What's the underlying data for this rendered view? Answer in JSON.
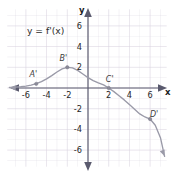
{
  "figure": {
    "kind": "coordinate-plane-graph",
    "background_color": "#ffffff",
    "grid_color": "#d9d3e0",
    "axis_color": "#5a5a6e",
    "curve_color": "#9a9aa8",
    "label_color": "#262626"
  },
  "annotations": {
    "function_label": "y = f'(x)",
    "x_axis_name": "x",
    "y_axis_name": "y"
  },
  "axes": {
    "x_ticks": [
      "-6",
      "-4",
      "-2",
      "2",
      "4",
      "6"
    ],
    "y_ticks": [
      "6",
      "4",
      "2",
      "-2",
      "-4",
      "-6"
    ],
    "x_tick_values": [
      -6,
      -4,
      -2,
      2,
      4,
      6
    ],
    "y_tick_values": [
      6,
      4,
      2,
      -2,
      -4,
      -6
    ],
    "xlim": [
      -7.8,
      7.6
    ],
    "ylim": [
      -7.6,
      7.6
    ],
    "grid": true,
    "grid_step": 1
  },
  "chart_data": {
    "type": "line",
    "title": "",
    "subtitle": "",
    "xlabel": "x",
    "ylabel": "y",
    "xlim": [
      -7.8,
      7.6
    ],
    "ylim": [
      -7.6,
      7.6
    ],
    "grid": true,
    "legend": "none",
    "annotations": [
      "y = f'(x)"
    ],
    "series": [
      {
        "name": "y = f'(x)",
        "color": "#9a9aa8",
        "arrow_start": true,
        "arrow_end": true,
        "x": [
          -7.6,
          -7.0,
          -6.5,
          -6.0,
          -5.5,
          -5.0,
          -4.5,
          -4.0,
          -3.5,
          -3.0,
          -2.5,
          -2.0,
          -1.5,
          -1.0,
          -0.5,
          0.0,
          0.5,
          1.0,
          1.5,
          2.0,
          2.5,
          3.0,
          3.5,
          4.0,
          4.5,
          5.0,
          5.5,
          6.0,
          6.5,
          7.0,
          7.4
        ],
        "y": [
          0.05,
          0.08,
          0.12,
          0.18,
          0.28,
          0.42,
          0.62,
          0.88,
          1.2,
          1.55,
          1.85,
          2.0,
          1.95,
          1.7,
          1.35,
          1.0,
          0.72,
          0.5,
          0.3,
          0.0,
          -0.35,
          -0.75,
          -1.15,
          -1.6,
          -2.05,
          -2.5,
          -2.8,
          -3.0,
          -3.6,
          -4.8,
          -6.6
        ]
      }
    ],
    "points": [
      {
        "label": "A'",
        "x": -5.0,
        "y": 0.4,
        "label_dx": -3,
        "label_dy": -7
      },
      {
        "label": "B'",
        "x": -2.0,
        "y": 2.0,
        "label_dx": -4,
        "label_dy": -6
      },
      {
        "label": "C'",
        "x": 2.0,
        "y": 0.0,
        "label_dx": 1,
        "label_dy": -6
      },
      {
        "label": "D'",
        "x": 6.0,
        "y": -3.0,
        "label_dx": 4,
        "label_dy": -2
      }
    ]
  }
}
